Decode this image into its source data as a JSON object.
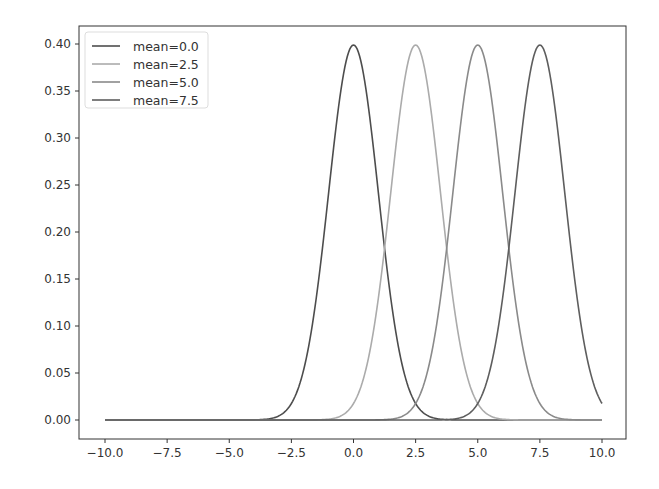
{
  "chart_data": {
    "type": "line",
    "title": "",
    "xlabel": "",
    "ylabel": "",
    "xlim": [
      -11.0,
      11.0
    ],
    "ylim": [
      -0.02,
      0.42
    ],
    "grid": false,
    "legend_position": "upper left",
    "x_ticks": [
      "−10.0",
      "−7.5",
      "−5.0",
      "−2.5",
      "0.0",
      "2.5",
      "5.0",
      "7.5",
      "10.0"
    ],
    "x_tick_values": [
      -10,
      -7.5,
      -5,
      -2.5,
      0,
      2.5,
      5,
      7.5,
      10
    ],
    "y_ticks": [
      "0.00",
      "0.05",
      "0.10",
      "0.15",
      "0.20",
      "0.25",
      "0.30",
      "0.35",
      "0.40"
    ],
    "y_tick_values": [
      0,
      0.05,
      0.1,
      0.15,
      0.2,
      0.25,
      0.3,
      0.35,
      0.4
    ],
    "x_range": [
      -10,
      10
    ],
    "distribution": "normal pdf, std=1",
    "series": [
      {
        "name": "mean=0.0",
        "mean": 0.0,
        "std": 1.0,
        "color": "#4d4d4d",
        "peak": 0.399
      },
      {
        "name": "mean=2.5",
        "mean": 2.5,
        "std": 1.0,
        "color": "#ababab",
        "peak": 0.399
      },
      {
        "name": "mean=5.0",
        "mean": 5.0,
        "std": 1.0,
        "color": "#8a8a8a",
        "peak": 0.399
      },
      {
        "name": "mean=7.5",
        "mean": 7.5,
        "std": 1.0,
        "color": "#5e5e5e",
        "peak": 0.399
      }
    ]
  }
}
